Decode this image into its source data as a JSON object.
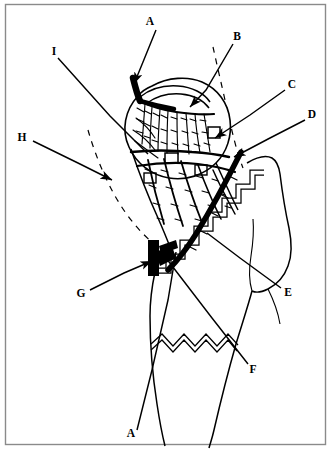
{
  "figure": {
    "background_color": "#ffffff",
    "ink_color": "#000000",
    "border_color": "#888888",
    "width": 331,
    "height": 449
  },
  "labels": [
    {
      "id": "label-a-top",
      "text": "A",
      "x": 150,
      "y": 22,
      "anchor": "middle"
    },
    {
      "id": "label-b",
      "text": "B",
      "x": 237,
      "y": 37,
      "anchor": "middle"
    },
    {
      "id": "label-c",
      "text": "C",
      "x": 292,
      "y": 85,
      "anchor": "middle"
    },
    {
      "id": "label-d",
      "text": "D",
      "x": 312,
      "y": 115,
      "anchor": "middle"
    },
    {
      "id": "label-i",
      "text": "I",
      "x": 54,
      "y": 52,
      "anchor": "middle"
    },
    {
      "id": "label-h",
      "text": "H",
      "x": 22,
      "y": 138,
      "anchor": "middle"
    },
    {
      "id": "label-e",
      "text": "E",
      "x": 288,
      "y": 293,
      "anchor": "middle"
    },
    {
      "id": "label-f",
      "text": "F",
      "x": 253,
      "y": 370,
      "anchor": "middle"
    },
    {
      "id": "label-g",
      "text": "G",
      "x": 81,
      "y": 294,
      "anchor": "middle"
    },
    {
      "id": "label-a-bottom",
      "text": "A",
      "x": 131,
      "y": 434,
      "anchor": "middle"
    }
  ],
  "leaders": [
    {
      "id": "leader-a-top",
      "from_label": "A",
      "kind": "arrow",
      "points": "156,30 143,62 134,84"
    },
    {
      "id": "leader-b",
      "from_label": "B",
      "kind": "arrow",
      "points": "233,44 206,90 190,107"
    },
    {
      "id": "leader-c",
      "from_label": "C",
      "kind": "arrow",
      "points": "285,90 250,115 215,138"
    },
    {
      "id": "leader-d",
      "from_label": "D",
      "kind": "arrow",
      "points": "305,120 270,138 234,157"
    },
    {
      "id": "leader-i",
      "from_label": "I",
      "kind": "plain",
      "points": "58,58 110,116 148,154"
    },
    {
      "id": "leader-h",
      "from_label": "H",
      "kind": "arrow",
      "points": "33,141 80,164 112,180"
    },
    {
      "id": "leader-e",
      "from_label": "E",
      "kind": "plain",
      "points": "281,288 240,258 207,233"
    },
    {
      "id": "leader-f",
      "from_label": "F",
      "kind": "plain",
      "points": "248,364 212,318 166,258"
    },
    {
      "id": "leader-g",
      "from_label": "G",
      "kind": "arrow",
      "points": "90,290 124,273 152,261"
    },
    {
      "id": "leader-a-bottom",
      "from_label": "A",
      "kind": "plain",
      "points": "137,430 152,370 168,300 176,252"
    }
  ],
  "structures": {
    "femoral_head_outline": "head-outline",
    "femoral_neck_outline": "neck-outline",
    "greater_trochanter": "trochanter-outline",
    "capsule_dashed_medial": "capsule-dashed-left",
    "capsule_dashed_lateral": "capsule-dashed-right",
    "trochanteric_osteotomy": "step-cut-osteotomy",
    "shaft_osteotomy": "zigzag-osteotomy",
    "main_artery": "thick-retinacular-artery",
    "vessel_network": "intraosseous-vessel-network",
    "bone_block": "black-bone-wedge"
  }
}
